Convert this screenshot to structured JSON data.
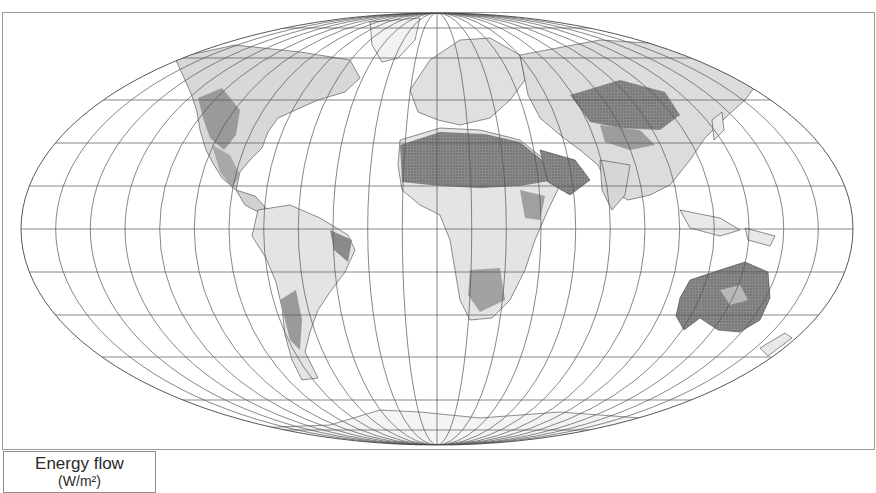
{
  "map": {
    "projection": "Mollweide",
    "style": {
      "background": "#ffffff",
      "graticule_color": "#555555",
      "border_color": "#444444",
      "land_fill_light": "#e6e6e6",
      "land_fill_mid": "#b5b5b5",
      "land_fill_dark": "#6e6e6e",
      "frame_color": "#9a9a9a"
    },
    "graticule": {
      "meridian_step_deg": 15,
      "parallel_step_deg": 15
    },
    "shading_regions": [
      {
        "name": "Sahara / Arabia",
        "intensity": "high"
      },
      {
        "name": "Australia interior",
        "intensity": "high"
      },
      {
        "name": "Tibetan Plateau / Central Asia",
        "intensity": "high"
      },
      {
        "name": "Western North America",
        "intensity": "medium"
      },
      {
        "name": "Andes / Patagonia",
        "intensity": "medium"
      },
      {
        "name": "Southern Africa",
        "intensity": "medium"
      },
      {
        "name": "Horn of Africa",
        "intensity": "medium"
      },
      {
        "name": "Northeast Brazil",
        "intensity": "medium"
      }
    ]
  },
  "legend": {
    "title": "Energy flow",
    "subtitle": "(W/m²)"
  }
}
